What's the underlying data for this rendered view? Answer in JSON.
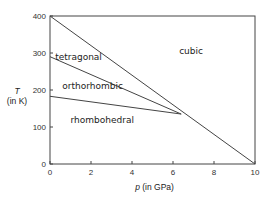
{
  "chart_data": {
    "type": "line",
    "title": "",
    "xlabel": "p (in GPa)",
    "xlabel_var": "p",
    "xlabel_unit": " (in GPa)",
    "ylabel_var": "T",
    "ylabel_unit": "(in K)",
    "xlim": [
      0,
      10
    ],
    "ylim": [
      0,
      400
    ],
    "xticks": [
      0,
      2,
      4,
      6,
      8,
      10
    ],
    "yticks": [
      0,
      100,
      200,
      300,
      400
    ],
    "grid": false,
    "series": [
      {
        "name": "cubic boundary",
        "points": [
          [
            0,
            400
          ],
          [
            10,
            0
          ]
        ]
      },
      {
        "name": "tetragonal-orthorhombic boundary",
        "points": [
          [
            0,
            290
          ],
          [
            6.4,
            135
          ]
        ]
      },
      {
        "name": "orthorhombic-rhombohedral boundary",
        "points": [
          [
            0,
            183
          ],
          [
            6.4,
            135
          ]
        ]
      }
    ],
    "regions": [
      {
        "label": "cubic",
        "p": 6.3,
        "T": 305
      },
      {
        "label": "tetragonal",
        "p": 0.25,
        "T": 290
      },
      {
        "label": "orthorhombic",
        "p": 0.6,
        "T": 210
      },
      {
        "label": "rhombohedral",
        "p": 1.0,
        "T": 120
      }
    ]
  }
}
